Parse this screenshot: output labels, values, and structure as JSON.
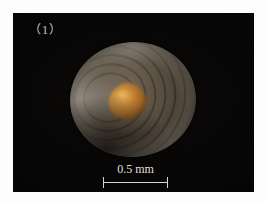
{
  "figure": {
    "panel_label": "（1）",
    "caption_visible": false
  },
  "photo": {
    "background_color": "#060505",
    "type": "light-micrograph"
  },
  "specimen": {
    "name": "circular-shell-specimen",
    "shape": "circular valve with concentric growth rings",
    "body_color": "#5d5244",
    "rim_color": "#c4beb2",
    "core_color": "#c8812a",
    "core_highlight_color": "#e0a03a"
  },
  "scale_bar": {
    "label": "0.5 mm",
    "value": 0.5,
    "unit": "mm",
    "color": "#d8d4cc",
    "length_px": 65,
    "end_caps": true
  },
  "colors": {
    "page_background": "#ffffff",
    "panel_background": "#060505",
    "label_text": "#cfc9c0",
    "scale_text": "#e4e0d8"
  }
}
